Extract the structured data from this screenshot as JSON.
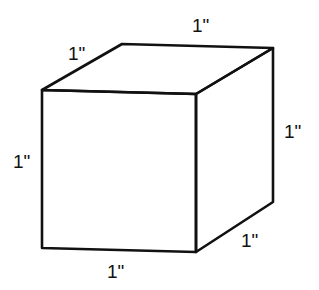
{
  "diagram": {
    "type": "cube",
    "stroke_color": "#111111",
    "background": "#ffffff",
    "labels": {
      "top_back_edge": "1\"",
      "top_left_edge": "1\"",
      "right_vertical_edge": "1\"",
      "left_vertical_edge": "1\"",
      "bottom_right_edge": "1\"",
      "bottom_front_edge": "1\""
    }
  }
}
